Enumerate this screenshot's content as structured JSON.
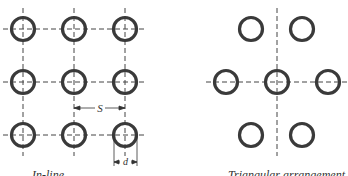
{
  "figure": {
    "left_panel": {
      "caption": "In-line",
      "dimension_labels": {
        "spacing": "S",
        "diameter": "d"
      },
      "tubes": [
        {
          "cx": 23,
          "cy": 29
        },
        {
          "cx": 74,
          "cy": 29
        },
        {
          "cx": 125,
          "cy": 29
        },
        {
          "cx": 23,
          "cy": 82
        },
        {
          "cx": 74,
          "cy": 82
        },
        {
          "cx": 125,
          "cy": 82
        },
        {
          "cx": 23,
          "cy": 135
        },
        {
          "cx": 74,
          "cy": 135
        },
        {
          "cx": 125,
          "cy": 135
        }
      ]
    },
    "right_panel": {
      "caption": "Triangular arrangement",
      "tubes": [
        {
          "cx": 251,
          "cy": 29
        },
        {
          "cx": 302,
          "cy": 29
        },
        {
          "cx": 226,
          "cy": 82
        },
        {
          "cx": 277,
          "cy": 82
        },
        {
          "cx": 328,
          "cy": 82
        },
        {
          "cx": 251,
          "cy": 135
        },
        {
          "cx": 302,
          "cy": 135
        }
      ]
    },
    "colors": {
      "ring": "#3a3a3a",
      "line": "#444444"
    }
  }
}
